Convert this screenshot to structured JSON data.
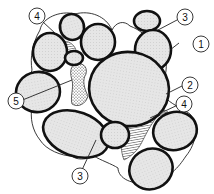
{
  "diagram": {
    "type": "microstructure-cross-section",
    "colors": {
      "grain_fill": "#e4e4e4",
      "grain_outline": "#111111",
      "background": "#ffffff",
      "line": "#222222"
    },
    "callouts": [
      {
        "id": "1",
        "label": "1",
        "target": "grain outline (boundary of large grain, upper right)"
      },
      {
        "id": "2",
        "label": "2",
        "target": "thin film / envelope around grains (right side)"
      },
      {
        "id": "3a",
        "label": "3",
        "target": "small grain (top right)"
      },
      {
        "id": "3b",
        "label": "3",
        "target": "grain contact (bottom centre)"
      },
      {
        "id": "4a",
        "label": "4",
        "target": "hatched pore fill (top left)"
      },
      {
        "id": "4b",
        "label": "4",
        "target": "hatched pore fill (lower right)"
      },
      {
        "id": "5",
        "label": "5",
        "target": "dotted pore fill (centre left)"
      }
    ]
  }
}
